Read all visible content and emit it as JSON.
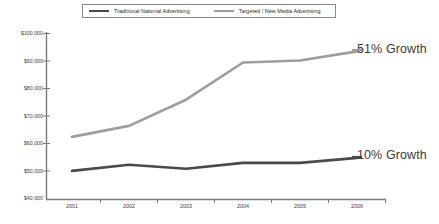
{
  "legend": {
    "position": "top",
    "entries": [
      {
        "label": "Traditional National Advertising",
        "color": "#4a4a4a",
        "key": "traditional"
      },
      {
        "label": "Targeted / New Media Advertising",
        "color": "#9d9d9d",
        "key": "targeted"
      }
    ]
  },
  "annotations": {
    "targeted_growth": "51% Growth",
    "traditional_growth": "10% Growth"
  },
  "axis": {
    "y_ticks": [
      "$100,000",
      "$90,000",
      "$80,000",
      "$70,000",
      "$60,000",
      "$50,000",
      "$40,000"
    ],
    "x_ticks": [
      "2001",
      "2002",
      "2003",
      "2004",
      "2005",
      "2006"
    ]
  },
  "chart_data": {
    "type": "line",
    "title": "",
    "subtitle": "",
    "xlabel": "",
    "ylabel": "",
    "categories": [
      "2001",
      "2002",
      "2003",
      "2004",
      "2005",
      "2006"
    ],
    "x": [
      2001,
      2002,
      2003,
      2004,
      2005,
      2006
    ],
    "ylim": [
      40000,
      100000
    ],
    "y_tick_values": [
      100000,
      90000,
      80000,
      70000,
      60000,
      50000,
      40000
    ],
    "y_tick_labels": [
      "$100,000",
      "$90,000",
      "$80,000",
      "$70,000",
      "$60,000",
      "$50,000",
      "$40,000"
    ],
    "y_tick_step": 10000,
    "grid": false,
    "legend_position": "top",
    "series": [
      {
        "name": "Traditional National Advertising",
        "color": "#4a4a4a",
        "values": [
          50200,
          52400,
          51000,
          53100,
          53100,
          54900
        ],
        "annotation": "10% Growth"
      },
      {
        "name": "Targeted / New Media Advertising",
        "color": "#9d9d9d",
        "values": [
          62500,
          66500,
          76000,
          89500,
          90200,
          93500
        ],
        "annotation": "51% Growth"
      }
    ],
    "annotations": [
      {
        "text": "51% Growth",
        "series": "Targeted / New Media Advertising",
        "at_x": 2006
      },
      {
        "text": "10% Growth",
        "series": "Traditional National Advertising",
        "at_x": 2006
      }
    ]
  },
  "colors": {
    "axis": "#6f6f6f",
    "traditional": "#4a4a4a",
    "targeted": "#9d9d9d",
    "text": "#3b3b3b",
    "background": "#ffffff"
  }
}
